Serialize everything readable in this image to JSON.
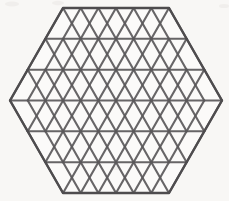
{
  "figure": {
    "name": "triangulated-hexagon",
    "title": "Hexagon subdivided into equilateral triangles",
    "shape": "regular hexagon",
    "orientation": "pointy-left-right",
    "background_color": "#f8f7f5",
    "line_color": "#5a585a",
    "line_width_px": 2.1,
    "canvas": {
      "width": 229,
      "height": 201
    }
  },
  "geometry": {
    "center": {
      "x": 116,
      "y": 100.5
    },
    "vertex_left": {
      "x": 10,
      "y": 100.5
    },
    "vertex_right": {
      "x": 222,
      "y": 100.5
    },
    "top_edge_y": 8,
    "bottom_edge_y": 193,
    "top_edge_x_start": 63,
    "top_edge_x_end": 169,
    "rows": 6,
    "columns_per_side": 3,
    "cell_width": 35.3,
    "cell_height": 30.8,
    "triangles_per_row": [
      7,
      9,
      11,
      11,
      9,
      7
    ],
    "total_triangles": 54,
    "row_y_positions": [
      8,
      38.8,
      69.7,
      100.5,
      131.3,
      162.2,
      193
    ],
    "horizontal_line_count": 7
  },
  "legend": {
    "visible": false,
    "entries": []
  },
  "labels": {
    "visible": false,
    "items": []
  }
}
